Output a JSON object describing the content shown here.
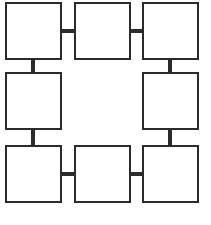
{
  "diagram": {
    "title": "",
    "type": "ring-grid",
    "background_color": "#ffffff",
    "stroke_color": "#2b2b2b",
    "fill_color": "#ffffff",
    "border_width_px": 2,
    "connector_width_px": 4,
    "grid": {
      "columns": 3,
      "rows": 3,
      "center_cell": "empty"
    },
    "nodes": [
      {
        "id": "node-top-left",
        "label": "",
        "x": 5,
        "y": 2,
        "w": 57,
        "h": 58
      },
      {
        "id": "node-top-center",
        "label": "",
        "x": 74,
        "y": 2,
        "w": 57,
        "h": 58
      },
      {
        "id": "node-top-right",
        "label": "",
        "x": 142,
        "y": 2,
        "w": 57,
        "h": 58
      },
      {
        "id": "node-middle-left",
        "label": "",
        "x": 5,
        "y": 72,
        "w": 57,
        "h": 58
      },
      {
        "id": "node-middle-right",
        "label": "",
        "x": 142,
        "y": 72,
        "w": 57,
        "h": 58
      },
      {
        "id": "node-bottom-left",
        "label": "",
        "x": 5,
        "y": 145,
        "w": 57,
        "h": 58
      },
      {
        "id": "node-bottom-center",
        "label": "",
        "x": 74,
        "y": 145,
        "w": 57,
        "h": 58
      },
      {
        "id": "node-bottom-right",
        "label": "",
        "x": 142,
        "y": 145,
        "w": 57,
        "h": 58
      }
    ],
    "connectors": [
      {
        "id": "connector-top-left-to-top-center",
        "from": "node-top-left",
        "to": "node-top-center",
        "orientation": "horizontal",
        "x": 60,
        "y": 29,
        "w": 16,
        "h": 4
      },
      {
        "id": "connector-top-center-to-top-right",
        "from": "node-top-center",
        "to": "node-top-right",
        "orientation": "horizontal",
        "x": 129,
        "y": 29,
        "w": 15,
        "h": 4
      },
      {
        "id": "connector-top-left-to-middle-left",
        "from": "node-top-left",
        "to": "node-middle-left",
        "orientation": "vertical",
        "x": 31,
        "y": 58,
        "w": 4,
        "h": 16
      },
      {
        "id": "connector-middle-left-to-bottom-left",
        "from": "node-middle-left",
        "to": "node-bottom-left",
        "orientation": "vertical",
        "x": 31,
        "y": 128,
        "w": 4,
        "h": 19
      },
      {
        "id": "connector-top-right-to-middle-right",
        "from": "node-top-right",
        "to": "node-middle-right",
        "orientation": "vertical",
        "x": 168,
        "y": 58,
        "w": 4,
        "h": 16
      },
      {
        "id": "connector-middle-right-to-bottom-right",
        "from": "node-middle-right",
        "to": "node-bottom-right",
        "orientation": "vertical",
        "x": 168,
        "y": 128,
        "w": 4,
        "h": 19
      },
      {
        "id": "connector-bottom-left-to-bottom-center",
        "from": "node-bottom-left",
        "to": "node-bottom-center",
        "orientation": "horizontal",
        "x": 60,
        "y": 172,
        "w": 16,
        "h": 4
      },
      {
        "id": "connector-bottom-center-to-bottom-right",
        "from": "node-bottom-center",
        "to": "node-bottom-right",
        "orientation": "horizontal",
        "x": 129,
        "y": 172,
        "w": 15,
        "h": 4
      }
    ]
  }
}
